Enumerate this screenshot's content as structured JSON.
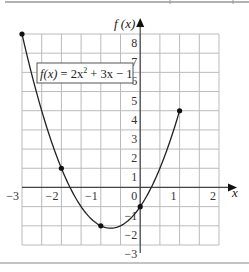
{
  "chart_data": {
    "type": "line",
    "title": "",
    "function_label": "f(x) = 2x² + 3x − 1",
    "function_label_parts": {
      "lhs": "f(x)",
      "mid": " = 2x",
      "sup": "2",
      "rhs": " + 3x − 1"
    },
    "xlabel": "x",
    "ylabel": "f (x)",
    "xlim": [
      -3,
      2
    ],
    "ylim": [
      -3,
      8
    ],
    "grid": true,
    "grid_step_x": 0.5,
    "grid_step_y": 1,
    "xticks": [
      -3,
      -2,
      -1,
      0,
      1,
      2
    ],
    "xtick_labels": [
      "−3",
      "−2",
      "−1",
      "0",
      "1",
      "2"
    ],
    "yticks": [
      8,
      7,
      6,
      5,
      4,
      3,
      2,
      1,
      -1,
      -2,
      -3
    ],
    "ytick_labels": [
      "8",
      "7",
      "6",
      "5",
      "4",
      "3",
      "2",
      "1",
      "−1",
      "−2",
      "−3"
    ],
    "series": [
      {
        "name": "f(x) = 2x^2 + 3x - 1",
        "coefficients": {
          "a": 2,
          "b": 3,
          "c": -1
        },
        "domain": [
          -3,
          1
        ],
        "points": [
          {
            "x": -3,
            "y": 8
          },
          {
            "x": -2,
            "y": 1
          },
          {
            "x": -1,
            "y": -2
          },
          {
            "x": 0,
            "y": -1
          },
          {
            "x": 1,
            "y": 4
          }
        ]
      }
    ]
  }
}
